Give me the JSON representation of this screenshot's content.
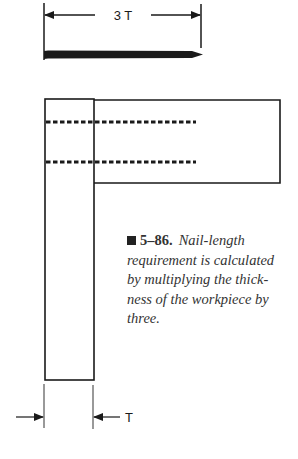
{
  "figure": {
    "number": "5–86.",
    "caption": "Nail-length requirement is calculated by multiplying the thick­ness of the workpiece by three.",
    "caption_lines": [
      "Nail-length",
      "requirement is calculated",
      "by multiplying the thick-",
      "ness of the workpiece by",
      "three."
    ]
  },
  "dimensions": {
    "nail_length_label": "3 T",
    "thickness_label": "T"
  },
  "colors": {
    "line": "#1a1a1a",
    "caption_text": "#333333"
  }
}
